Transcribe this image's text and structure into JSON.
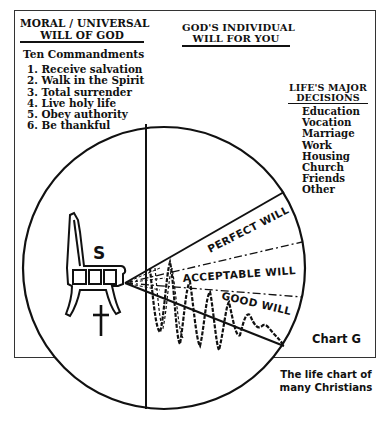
{
  "moral_will": {
    "heading_line1": "MORAL / UNIVERSAL",
    "heading_line2": "WILL OF GOD",
    "subheading": "Ten Commandments",
    "items": [
      "1. Receive salvation",
      "2. Walk in the Spirit",
      "3. Total surrender",
      "4. Live holy life",
      "5. Obey authority",
      "6. Be thankful"
    ]
  },
  "individual_will": {
    "heading_line1": "GOD'S INDIVIDUAL",
    "heading_line2": "WILL FOR YOU"
  },
  "major_decisions": {
    "heading_line1": "LIFE'S MAJOR",
    "heading_line2": "DECISIONS",
    "items": [
      "Education",
      "Vocation",
      "Marriage",
      "Work",
      "Housing",
      "Church",
      "Friends",
      "Other"
    ]
  },
  "diagram": {
    "throne_letter": "S",
    "cross_symbol": "✝",
    "wedges": {
      "perfect": "PERFECT WILL",
      "acceptable": "ACCEPTABLE WILL",
      "good": "GOOD WILL"
    },
    "line_color": "#111111"
  },
  "chart_label": "Chart G",
  "caption": {
    "line1": "The life chart of",
    "line2": "many Christians"
  }
}
